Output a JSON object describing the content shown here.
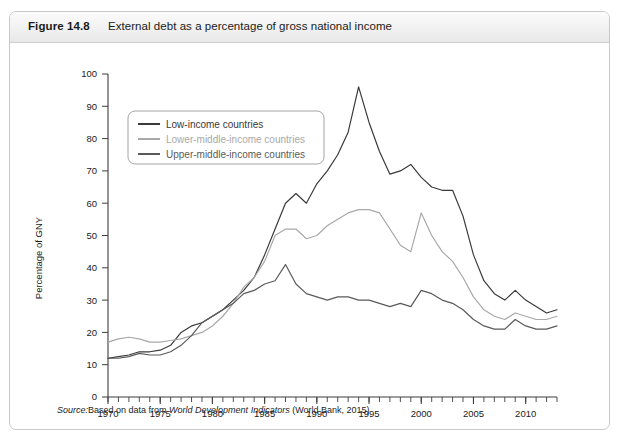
{
  "figure": {
    "number": "Figure 14.8",
    "title": "External debt as a percentage of gross national income",
    "source_prefix": "Source:",
    "source_text_1": "Based on data from ",
    "source_italic": "World Development Indicators",
    "source_text_2": " (World Bank, 2015)"
  },
  "colors": {
    "low_income": "#3a3a3a",
    "lower_middle_income": "#a9a9a9",
    "upper_middle_income": "#5a5a5a",
    "axis": "#3d3d3d",
    "header_text": "#1b1b1b",
    "card_border": "#c8c8c8"
  },
  "legend": {
    "items": [
      {
        "label": "Low-income countries",
        "color": "#3a3a3a"
      },
      {
        "label": "Lower-middle-income countries",
        "color": "#a9a9a9"
      },
      {
        "label": "Upper-middle-income countries",
        "color": "#5a5a5a"
      }
    ]
  },
  "chart_data": {
    "type": "line",
    "title": "External debt as a percentage of gross national income",
    "xlabel": "",
    "ylabel": "Percentage of GNY",
    "xlim": [
      1970,
      2013
    ],
    "ylim": [
      0,
      100
    ],
    "yticks": [
      0,
      10,
      20,
      30,
      40,
      50,
      60,
      70,
      80,
      90,
      100
    ],
    "xticks": [
      1970,
      1975,
      1980,
      1985,
      1990,
      1995,
      2000,
      2005,
      2010
    ],
    "xtick_minor_step": 1,
    "grid": false,
    "legend_position": "top-left",
    "x": [
      1970,
      1971,
      1972,
      1973,
      1974,
      1975,
      1976,
      1977,
      1978,
      1979,
      1980,
      1981,
      1982,
      1983,
      1984,
      1985,
      1986,
      1987,
      1988,
      1989,
      1990,
      1991,
      1992,
      1993,
      1994,
      1995,
      1996,
      1997,
      1998,
      1999,
      2000,
      2001,
      2002,
      2003,
      2004,
      2005,
      2006,
      2007,
      2008,
      2009,
      2010,
      2011,
      2012,
      2013
    ],
    "series": [
      {
        "name": "Low-income countries",
        "color": "#3a3a3a",
        "values": [
          12,
          12.5,
          13,
          14,
          14,
          14.5,
          16,
          20,
          22,
          23,
          25,
          27,
          30,
          33,
          37,
          44,
          52,
          60,
          63,
          60,
          66,
          70,
          75,
          82,
          96,
          85,
          76,
          69,
          70,
          72,
          68,
          65,
          64,
          64,
          56,
          44,
          36,
          32,
          30,
          33,
          30,
          28,
          26,
          27
        ]
      },
      {
        "name": "Lower-middle-income countries",
        "color": "#a9a9a9",
        "values": [
          17,
          18,
          18.5,
          18,
          17,
          17,
          17.5,
          18,
          19,
          20,
          22,
          25,
          29,
          34,
          37,
          42,
          50,
          52,
          52,
          49,
          50,
          53,
          55,
          57,
          58,
          58,
          57,
          52,
          47,
          45,
          57,
          50,
          45,
          42,
          37,
          31,
          27,
          25,
          24,
          26,
          25,
          24,
          24,
          25
        ]
      },
      {
        "name": "Upper-middle-income countries",
        "color": "#5a5a5a",
        "values": [
          12,
          12,
          12.5,
          13.5,
          13,
          13,
          14,
          16,
          19,
          23,
          25,
          27,
          29,
          32,
          33,
          35,
          36,
          41,
          35,
          32,
          31,
          30,
          31,
          31,
          30,
          30,
          29,
          28,
          29,
          28,
          33,
          32,
          30,
          29,
          27,
          24,
          22,
          21,
          21,
          24,
          22,
          21,
          21,
          22
        ]
      }
    ]
  }
}
